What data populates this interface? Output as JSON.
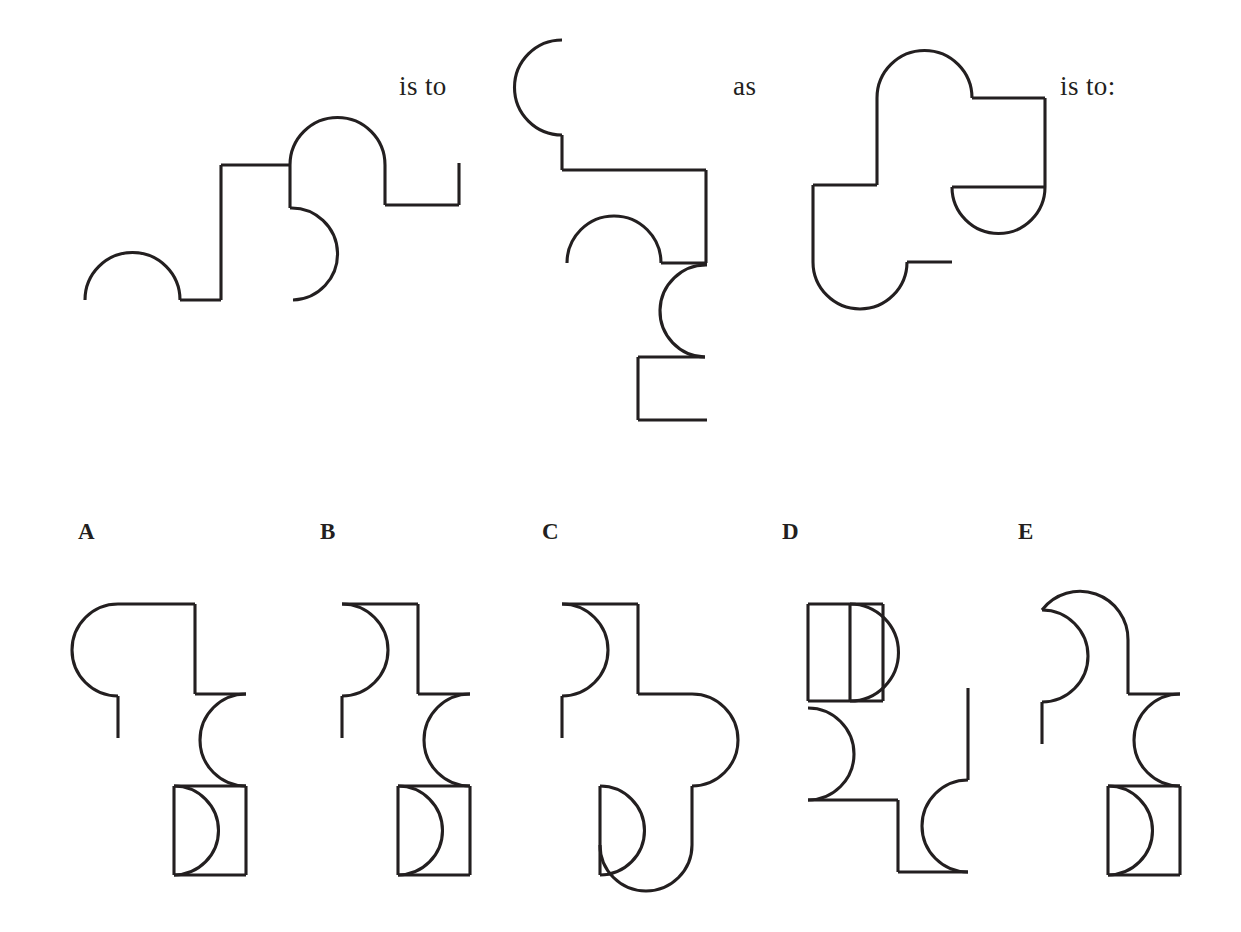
{
  "page": {
    "type": "visual-analogy-puzzle",
    "width": 1241,
    "height": 932,
    "background_color": "#ffffff",
    "stroke_color": "#231f20"
  },
  "prompt": {
    "connector_1": "is to",
    "connector_2": "as",
    "connector_3": "is to:"
  },
  "stem_figures": [
    {
      "id": "stem-1",
      "name": "first-analogy-figure",
      "description": "Stepped outline with a left semicircular bump on the baseline, a tall riser, a large dome arc, a right-facing inner semicircle, and a right step ending in an upward stub."
    },
    {
      "id": "stem-2",
      "name": "second-analogy-figure",
      "description": "Same outline rotated ninety degrees clockwise: top-left concave hook, horizontal ledge, inner dome arc, right-bulging semicircle, and a bottom rectangular notch."
    },
    {
      "id": "stem-3",
      "name": "third-analogy-figure",
      "description": "Blocky cross-like outline with a dome on top, a half-disc hanging from the right ledge, and a rounded bottom-left lobe with a short horizontal stub."
    }
  ],
  "options": [
    {
      "letter": "A",
      "name": "option-a",
      "description": "Rounded top-left lobe, down stub, right step with concave right arc, and a bottom box containing a right-bulging half-disc."
    },
    {
      "letter": "B",
      "name": "option-b",
      "description": "Concave top-left arc, down stub, right step with concave right arc, and a bottom box containing a right-bulging half-disc."
    },
    {
      "letter": "C",
      "name": "option-c",
      "description": "Concave top-left arc, down stub, large right-bulging lobe, and a rounded bottom pocket containing a half-disc."
    },
    {
      "letter": "D",
      "name": "option-d",
      "description": "Rectangular top box containing a half-disc, concave left arc, bottom step, and a detached vertical line with a concave arc."
    },
    {
      "letter": "E",
      "name": "option-e",
      "description": "Domed top lobe, concave left arc, down stub, right step with concave right arc, and a bottom box containing a right-bulging half-disc."
    }
  ],
  "layout": {
    "connector_1_pos": {
      "x": 399,
      "y": 71
    },
    "connector_2_pos": {
      "x": 733,
      "y": 71
    },
    "connector_3_pos": {
      "x": 1060,
      "y": 71
    },
    "option_letters_y": 519,
    "option_letters_x": [
      78,
      320,
      542,
      782,
      1018
    ]
  }
}
